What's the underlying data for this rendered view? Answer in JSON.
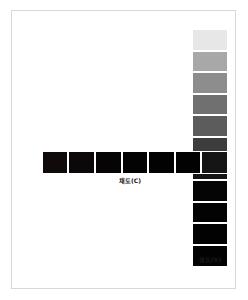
{
  "figure": {
    "kind": "munsell-color-scale-diagram",
    "background_color": "#ffffff",
    "frame_color": "#d8d8d8",
    "swatch_gap_color": "#ffffff"
  },
  "axes": {
    "value": {
      "label": "명도(V)",
      "label_position": "bottom",
      "orientation": "vertical",
      "direction": "light-to-dark"
    },
    "chroma": {
      "label": "채도(C)",
      "label_position": "below-center",
      "orientation": "horizontal",
      "direction": "low-to-high"
    }
  },
  "chart_data": {
    "type": "heatmap",
    "title": "",
    "subtitle": "",
    "xlabel": "채도(C)",
    "ylabel": "명도(V)",
    "legend": "none",
    "grid": false,
    "value_column": {
      "count": 11,
      "order": "top-to-bottom",
      "colors": [
        "#e7e7e7",
        "#a8a8a8",
        "#8d8d8d",
        "#707070",
        "#5c5c5c",
        "#3d3d3d",
        "#151515",
        "#050505",
        "#030303",
        "#020202",
        "#020202"
      ],
      "levels": [
        10,
        9,
        8,
        7,
        6,
        5,
        4,
        3,
        2,
        1,
        0
      ]
    },
    "chroma_row": {
      "count": 7,
      "order": "left-to-right",
      "colors": [
        "#100a0b",
        "#0c0708",
        "#060405",
        "#040303",
        "#030202",
        "#030202",
        "#151515"
      ],
      "levels": [
        1,
        2,
        3,
        4,
        5,
        6,
        7
      ]
    }
  }
}
